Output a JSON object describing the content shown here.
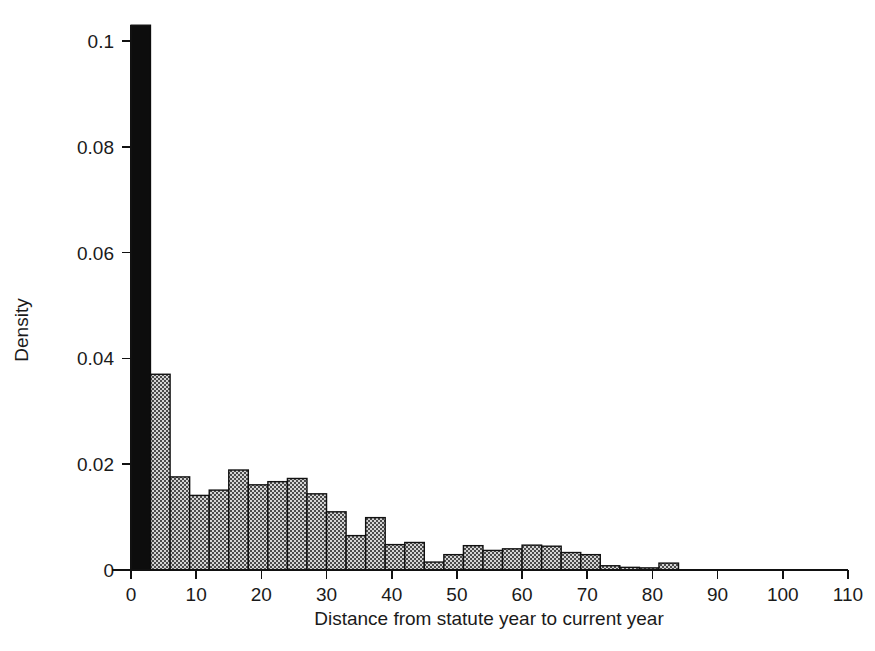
{
  "chart_data": {
    "type": "bar",
    "title": "",
    "subtitle": "",
    "xlabel": "Distance from statute year to current year",
    "ylabel": "Density",
    "xlim": [
      -3,
      112
    ],
    "ylim": [
      0,
      0.105
    ],
    "grid": false,
    "legend": null,
    "bin_width": 3,
    "xticks": [
      0,
      10,
      20,
      30,
      40,
      50,
      60,
      70,
      80,
      90,
      100,
      110
    ],
    "xtick_labels": [
      "0",
      "10",
      "20",
      "30",
      "40",
      "50",
      "60",
      "70",
      "80",
      "90",
      "100",
      "110"
    ],
    "yticks": [
      0,
      0.02,
      0.04,
      0.06,
      0.08,
      0.1
    ],
    "ytick_labels": [
      "0",
      "0.02",
      "0.04",
      "0.06",
      "0.08",
      "0.1"
    ],
    "bin_starts": [
      0,
      3,
      6,
      9,
      12,
      15,
      18,
      21,
      24,
      27,
      30,
      33,
      36,
      39,
      42,
      45,
      48,
      51,
      54,
      57,
      60,
      63,
      66,
      69,
      72,
      75,
      78,
      81
    ],
    "values": [
      0.103,
      0.037,
      0.0176,
      0.0141,
      0.0151,
      0.0189,
      0.0161,
      0.0167,
      0.0173,
      0.0144,
      0.011,
      0.0065,
      0.0099,
      0.0048,
      0.0052,
      0.0015,
      0.0029,
      0.0046,
      0.0037,
      0.004,
      0.0047,
      0.0045,
      0.0033,
      0.0029,
      0.0008,
      0.0005,
      0.0004,
      0.0013
    ],
    "colors": {
      "highlight_bar": "#0d0d0d",
      "bar_fill": "#8a8a8a",
      "bar_stroke": "#111111",
      "axis": "#111111",
      "background": "#ffffff"
    },
    "highlight_bin_index": 0
  }
}
